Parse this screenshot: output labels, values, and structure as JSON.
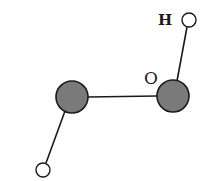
{
  "diagram": {
    "type": "molecule",
    "labels": {
      "hydrogen": "H",
      "oxygen": "O"
    },
    "colors": {
      "oxygen_fill": "#7a7a7a",
      "hydrogen_fill": "#ffffff",
      "stroke": "#1a1a1a"
    },
    "atoms": [
      {
        "id": "H1",
        "element": "H",
        "cx": 189,
        "cy": 20,
        "r": 7
      },
      {
        "id": "O1",
        "element": "O",
        "cx": 173,
        "cy": 96,
        "r": 16
      },
      {
        "id": "O2",
        "element": "O",
        "cx": 72,
        "cy": 97,
        "r": 16
      },
      {
        "id": "H2",
        "element": "H",
        "cx": 43,
        "cy": 170,
        "r": 7
      }
    ],
    "bonds": [
      {
        "from": "H1",
        "to": "O1"
      },
      {
        "from": "O1",
        "to": "O2"
      },
      {
        "from": "O2",
        "to": "H2"
      }
    ]
  }
}
